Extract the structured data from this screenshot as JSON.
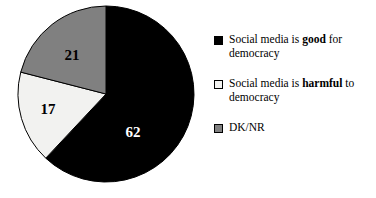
{
  "chart_data": {
    "type": "pie",
    "title": "",
    "subtitle": "",
    "xlabel": "",
    "ylabel": "",
    "categories": [
      "Social media is good for democracy",
      "Social media is harmful to democracy",
      "DK/NR"
    ],
    "values": [
      62,
      17,
      21
    ],
    "value_labels": [
      "62",
      "17",
      "21"
    ],
    "colors": [
      "#000000",
      "#f2f2f0",
      "#808080"
    ],
    "start_angle_deg": 0,
    "direction": "clockwise",
    "legend_position": "right",
    "grid": false,
    "units": "percent"
  },
  "legend": {
    "entries": [
      {
        "swatch_color": "#000000",
        "label_part1": "Social media is ",
        "label_bold": "good",
        "label_part2": " for",
        "label_line2": "democracy",
        "full_label": "Social media is good for democracy"
      },
      {
        "swatch_color": "#f2f2f0",
        "label_part1": "Social media is ",
        "label_bold": "harmful",
        "label_part2": " to",
        "label_line2": "democracy",
        "full_label": "Social media is harmful to democracy"
      },
      {
        "swatch_color": "#808080",
        "label_part1": "DK/NR",
        "label_bold": "",
        "label_part2": "",
        "label_line2": "",
        "full_label": "DK/NR"
      }
    ]
  },
  "pie": {
    "center_x": 106,
    "center_y": 94,
    "radius": 88,
    "outline_color": "#000000",
    "slices": [
      {
        "name": "good",
        "value": 62,
        "label": "62",
        "color": "#000000",
        "label_x": 133,
        "label_y": 137,
        "label_fill": "light"
      },
      {
        "name": "harmful",
        "value": 17,
        "label": "17",
        "color": "#f2f2f0",
        "label_x": 48,
        "label_y": 114,
        "label_fill": "dark"
      },
      {
        "name": "dknr",
        "value": 21,
        "label": "21",
        "color": "#808080",
        "label_x": 72,
        "label_y": 60,
        "label_fill": "dark"
      }
    ]
  }
}
